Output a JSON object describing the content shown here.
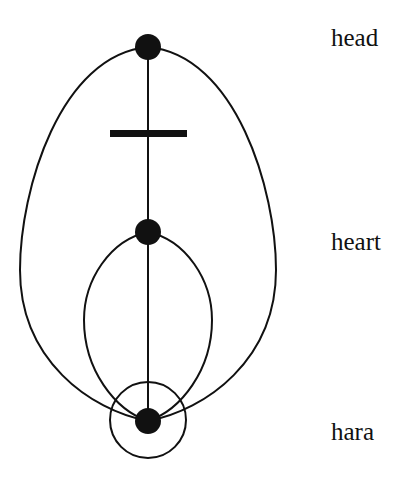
{
  "diagram": {
    "labels": {
      "head": "head",
      "heart": "heart",
      "hara": "hara"
    },
    "nodes": [
      {
        "id": "head",
        "cx": 148,
        "cy": 47
      },
      {
        "id": "heart",
        "cx": 148,
        "cy": 232
      },
      {
        "id": "hara",
        "cx": 148,
        "cy": 421
      }
    ],
    "colors": {
      "stroke": "#111111",
      "background": "#ffffff"
    }
  }
}
